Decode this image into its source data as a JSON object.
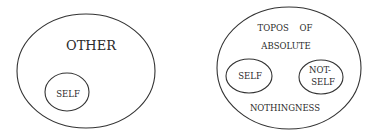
{
  "diagram_left": {
    "outer_label": "OTHER",
    "inner_label": "SELF"
  },
  "diagram_right": {
    "outer_label_line1": "TOPOS    OF",
    "outer_label_line2": "ABSOLUTE",
    "outer_label_line3": "NOTHINGNESS",
    "inner_left_label": "SELF",
    "inner_right_label_line1": "NOT-",
    "inner_right_label_line2": "SELF"
  }
}
